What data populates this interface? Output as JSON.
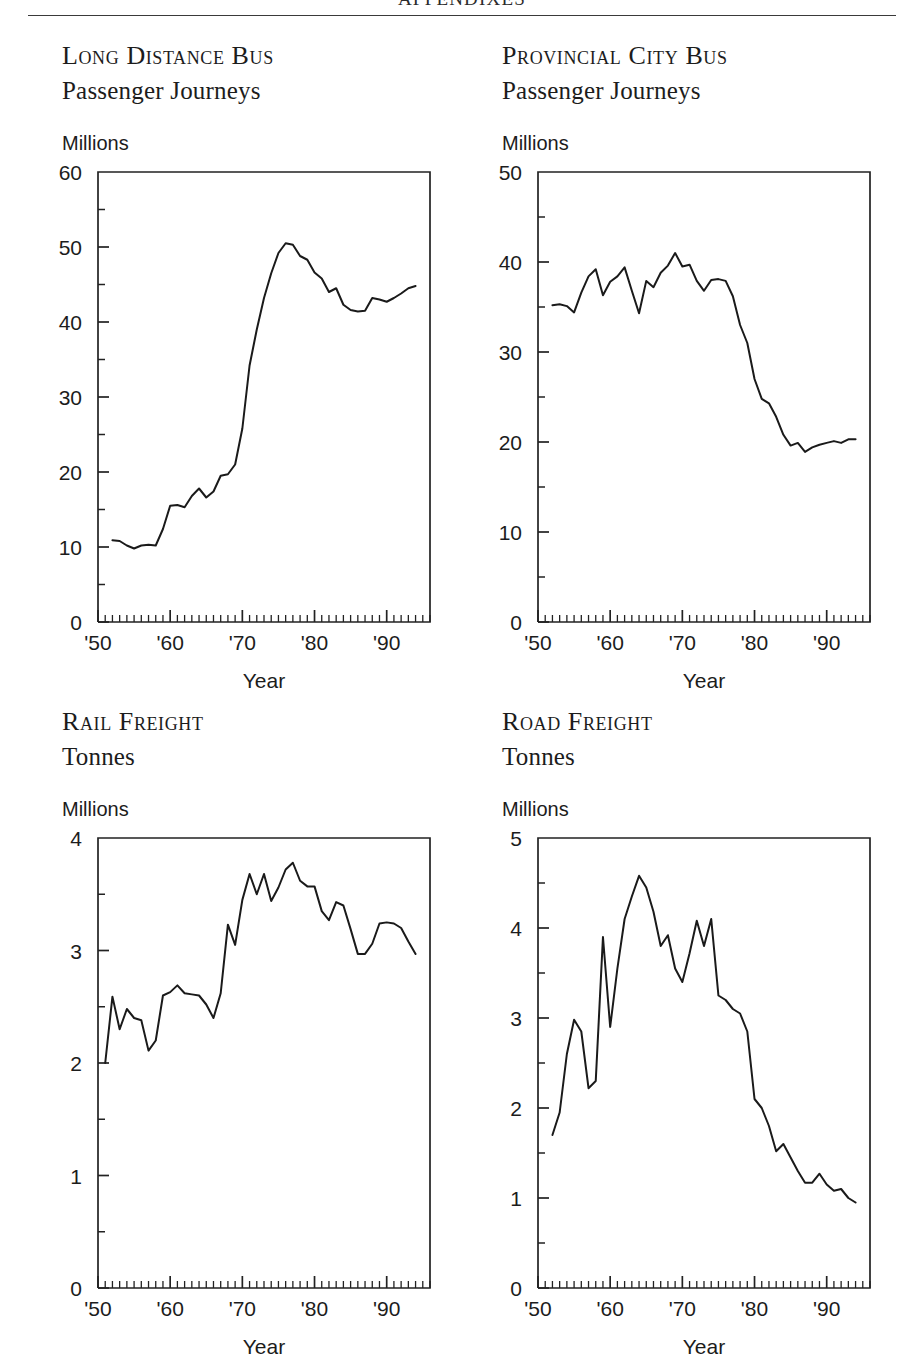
{
  "running_head": "APPENDIXES",
  "panels": [
    {
      "title_line1": "Long Distance Bus",
      "title_line2": "Passenger Journeys",
      "unit_label": "Millions",
      "xlabel": "Year",
      "chart_data": {
        "type": "line",
        "title": "Long Distance Bus Passenger Journeys",
        "subtitle": "Passenger Journeys",
        "xlabel": "Year",
        "ylabel": "Millions",
        "grid": false,
        "legend": "none",
        "xlim": [
          1950,
          1996
        ],
        "ylim": [
          0,
          60
        ],
        "yticks": [
          0,
          10,
          20,
          30,
          40,
          50,
          60
        ],
        "yticks_minor_step": 5,
        "xticks": [
          1950,
          1960,
          1970,
          1980,
          1990
        ],
        "xtick_labels": [
          "'50",
          "'60",
          "'70",
          "'80",
          "'90"
        ],
        "xticks_minor_step": 1,
        "x": [
          1952,
          1953,
          1954,
          1955,
          1956,
          1957,
          1958,
          1959,
          1960,
          1961,
          1962,
          1963,
          1964,
          1965,
          1966,
          1967,
          1968,
          1969,
          1970,
          1971,
          1972,
          1973,
          1974,
          1975,
          1976,
          1977,
          1978,
          1979,
          1980,
          1981,
          1982,
          1983,
          1984,
          1985,
          1986,
          1987,
          1988,
          1989,
          1990,
          1991,
          1992,
          1993,
          1994
        ],
        "y": [
          10.9,
          10.8,
          10.2,
          9.8,
          10.2,
          10.3,
          10.2,
          12.4,
          15.5,
          15.6,
          15.3,
          16.8,
          17.8,
          16.6,
          17.4,
          19.5,
          19.7,
          21.0,
          25.8,
          34.2,
          39.0,
          43.2,
          46.5,
          49.2,
          50.5,
          50.3,
          48.8,
          48.3,
          46.6,
          45.8,
          44.0,
          44.5,
          42.3,
          41.6,
          41.4,
          41.5,
          43.2,
          43.0,
          42.7,
          43.2,
          43.8,
          44.5,
          44.8
        ]
      }
    },
    {
      "title_line1": "Provincial City Bus",
      "title_line2": "Passenger Journeys",
      "unit_label": "Millions",
      "xlabel": "Year",
      "chart_data": {
        "type": "line",
        "title": "Provincial City Bus Passenger Journeys",
        "subtitle": "Passenger Journeys",
        "xlabel": "Year",
        "ylabel": "Millions",
        "grid": false,
        "legend": "none",
        "xlim": [
          1950,
          1996
        ],
        "ylim": [
          0,
          50
        ],
        "yticks": [
          0,
          10,
          20,
          30,
          40,
          50
        ],
        "yticks_minor_step": 5,
        "xticks": [
          1950,
          1960,
          1970,
          1980,
          1990
        ],
        "xtick_labels": [
          "'50",
          "'60",
          "'70",
          "'80",
          "'90"
        ],
        "xticks_minor_step": 1,
        "x": [
          1952,
          1953,
          1954,
          1955,
          1956,
          1957,
          1958,
          1959,
          1960,
          1961,
          1962,
          1963,
          1964,
          1965,
          1966,
          1967,
          1968,
          1969,
          1970,
          1971,
          1972,
          1973,
          1974,
          1975,
          1976,
          1977,
          1978,
          1979,
          1980,
          1981,
          1982,
          1983,
          1984,
          1985,
          1986,
          1987,
          1988,
          1989,
          1990,
          1991,
          1992,
          1993,
          1994
        ],
        "y": [
          35.2,
          35.3,
          35.1,
          34.4,
          36.6,
          38.4,
          39.2,
          36.3,
          37.8,
          38.4,
          39.4,
          36.8,
          34.3,
          37.9,
          37.2,
          38.8,
          39.6,
          41.0,
          39.5,
          39.7,
          37.9,
          36.8,
          38.0,
          38.1,
          37.9,
          36.2,
          33.0,
          31.0,
          27.0,
          24.8,
          24.3,
          22.8,
          20.8,
          19.6,
          19.9,
          18.9,
          19.4,
          19.7,
          19.9,
          20.1,
          19.9,
          20.3,
          20.3
        ]
      }
    },
    {
      "title_line1": "Rail Freight",
      "title_line2": "Tonnes",
      "unit_label": "Millions",
      "xlabel": "Year",
      "chart_data": {
        "type": "line",
        "title": "Rail Freight Tonnes",
        "subtitle": "Tonnes",
        "xlabel": "Year",
        "ylabel": "Millions",
        "grid": false,
        "legend": "none",
        "xlim": [
          1950,
          1996
        ],
        "ylim": [
          0,
          4
        ],
        "yticks": [
          0,
          1,
          2,
          3,
          4
        ],
        "yticks_minor_step": 0.5,
        "xticks": [
          1950,
          1960,
          1970,
          1980,
          1990
        ],
        "xtick_labels": [
          "'50",
          "'60",
          "'70",
          "'80",
          "'90"
        ],
        "xticks_minor_step": 1,
        "x": [
          1951,
          1952,
          1953,
          1954,
          1955,
          1956,
          1957,
          1958,
          1959,
          1960,
          1961,
          1962,
          1963,
          1964,
          1965,
          1966,
          1967,
          1968,
          1969,
          1970,
          1971,
          1972,
          1973,
          1974,
          1975,
          1976,
          1977,
          1978,
          1979,
          1980,
          1981,
          1982,
          1983,
          1984,
          1985,
          1986,
          1987,
          1988,
          1989,
          1990,
          1991,
          1992,
          1993,
          1994
        ],
        "y": [
          2.0,
          2.59,
          2.3,
          2.48,
          2.4,
          2.38,
          2.11,
          2.2,
          2.6,
          2.63,
          2.69,
          2.62,
          2.61,
          2.6,
          2.52,
          2.4,
          2.62,
          3.23,
          3.05,
          3.45,
          3.68,
          3.5,
          3.68,
          3.44,
          3.56,
          3.72,
          3.78,
          3.62,
          3.57,
          3.57,
          3.35,
          3.27,
          3.43,
          3.4,
          3.19,
          2.97,
          2.97,
          3.06,
          3.24,
          3.25,
          3.24,
          3.2,
          3.08,
          2.97
        ]
      }
    },
    {
      "title_line1": "Road Freight",
      "title_line2": "Tonnes",
      "unit_label": "Millions",
      "xlabel": "Year",
      "chart_data": {
        "type": "line",
        "title": "Road Freight Tonnes",
        "subtitle": "Tonnes",
        "xlabel": "Year",
        "ylabel": "Millions",
        "grid": false,
        "legend": "none",
        "xlim": [
          1950,
          1996
        ],
        "ylim": [
          0,
          5
        ],
        "yticks": [
          0,
          1,
          2,
          3,
          4,
          5
        ],
        "yticks_minor_step": 0.5,
        "xticks": [
          1950,
          1960,
          1970,
          1980,
          1990
        ],
        "xtick_labels": [
          "'50",
          "'60",
          "'70",
          "'80",
          "'90"
        ],
        "xticks_minor_step": 1,
        "x": [
          1952,
          1953,
          1954,
          1955,
          1956,
          1957,
          1958,
          1959,
          1960,
          1961,
          1962,
          1963,
          1964,
          1965,
          1966,
          1967,
          1968,
          1969,
          1970,
          1971,
          1972,
          1973,
          1974,
          1975,
          1976,
          1977,
          1978,
          1979,
          1980,
          1981,
          1982,
          1983,
          1984,
          1985,
          1986,
          1987,
          1988,
          1989,
          1990,
          1991,
          1992,
          1993,
          1994
        ],
        "y": [
          1.7,
          1.95,
          2.6,
          2.98,
          2.85,
          2.22,
          2.3,
          3.9,
          2.9,
          3.55,
          4.1,
          4.35,
          4.58,
          4.45,
          4.18,
          3.8,
          3.92,
          3.55,
          3.4,
          3.72,
          4.08,
          3.8,
          4.1,
          3.25,
          3.2,
          3.1,
          3.05,
          2.85,
          2.1,
          2.0,
          1.8,
          1.52,
          1.6,
          1.45,
          1.3,
          1.17,
          1.17,
          1.27,
          1.15,
          1.08,
          1.1,
          1.0,
          0.95,
          0.88
        ]
      }
    }
  ]
}
